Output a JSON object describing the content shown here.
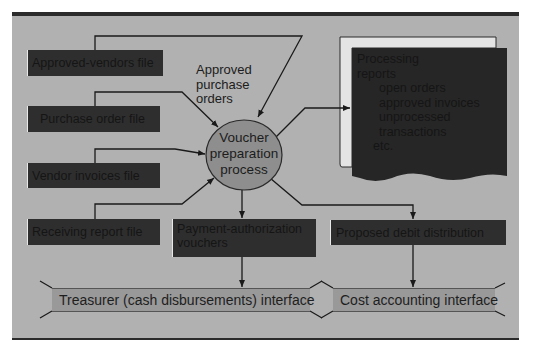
{
  "colors": {
    "panel_background": "#b1b1b1",
    "file_box": "#2e2e2e",
    "process_fill": "#8e8e8e",
    "interface_fill": "#999999",
    "line": "#1a1a1a"
  },
  "inputs": [
    {
      "label": "Approved-vendors file"
    },
    {
      "label": "Purchase order file"
    },
    {
      "label": "Vendor invoices file"
    },
    {
      "label": "Receiving report file"
    }
  ],
  "annotation": "Approved purchase orders",
  "process": {
    "line1": "Voucher",
    "line2": "preparation",
    "line3": "process"
  },
  "report": {
    "title": "Processing reports",
    "items": [
      "open orders",
      "approved invoices",
      "unprocessed transactions"
    ],
    "etc": "etc."
  },
  "outputs": {
    "vouchers": "Payment-authorization vouchers",
    "debit": "Proposed debit distribution"
  },
  "interfaces": {
    "treasurer": "Treasurer (cash disbursements) interface",
    "cost": "Cost accounting interface"
  }
}
